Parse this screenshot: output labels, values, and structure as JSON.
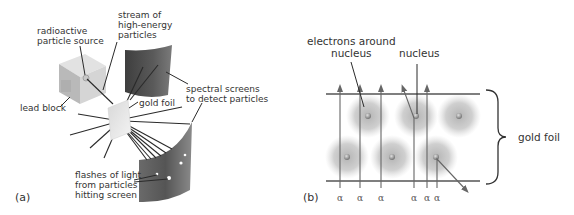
{
  "figure": {
    "panel_a": {
      "label": "(a)",
      "labels": {
        "radioactive_source_line1": "radioactive",
        "radioactive_source_line2": "particle source",
        "stream_line1": "stream of",
        "stream_line2": "high-energy",
        "stream_line3": "particles",
        "lead_block": "lead block",
        "gold_foil": "gold foil",
        "screens_line1": "spectral screens",
        "screens_line2": "to detect particles",
        "flashes_line1": "flashes of light",
        "flashes_line2": "from particles",
        "flashes_line3": "hitting screen"
      }
    },
    "panel_b": {
      "label": "(b)",
      "labels": {
        "electrons_line1": "electrons around",
        "electrons_line2": "nucleus",
        "nucleus": "nucleus",
        "gold_foil": "gold foil"
      },
      "alpha_symbol": "α",
      "alpha_count": 6
    },
    "colors": {
      "line": "#2a2a2a",
      "arrow": "#666666",
      "screen_dark": "#4a4a4a",
      "screen_light": "#9a9a9a",
      "electron_cloud": "#9c9c9c",
      "nucleus": "#9a9a9a"
    }
  }
}
